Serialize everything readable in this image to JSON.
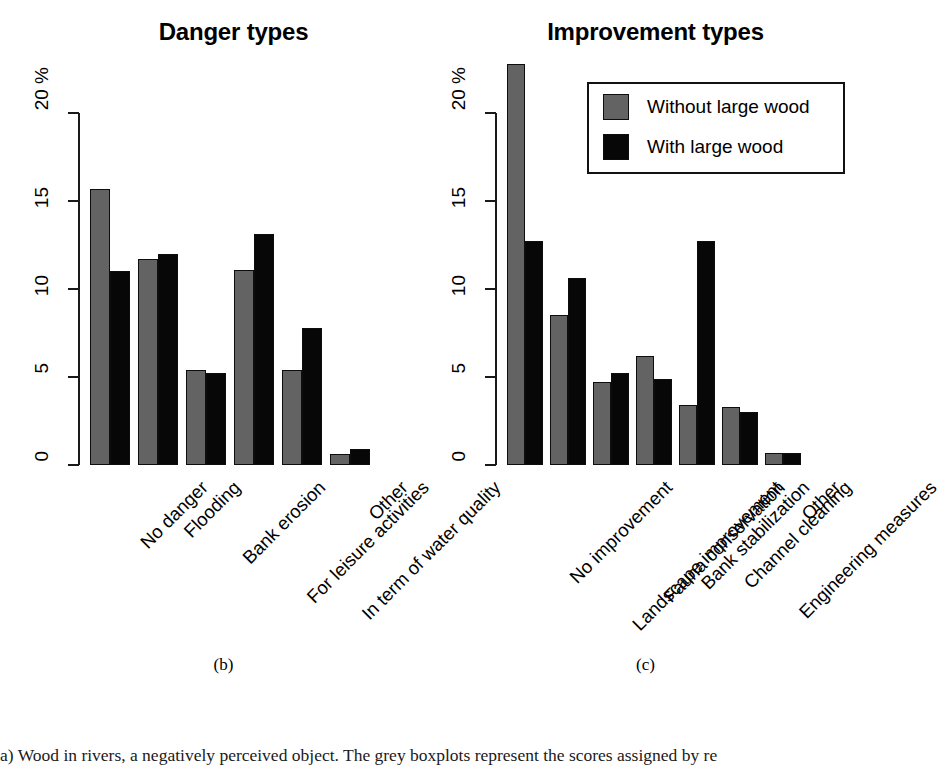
{
  "chart_data": [
    {
      "type": "bar",
      "title": "Danger types",
      "panel_letter": "(b)",
      "xlabel": "",
      "ylabel": "20 %",
      "yticks": [
        0,
        5,
        10,
        15,
        20
      ],
      "ytick_labels": [
        "0",
        "5",
        "10",
        "15",
        "20 %"
      ],
      "ylim": [
        0,
        23
      ],
      "grid": false,
      "categories": [
        "No danger",
        "Flooding",
        "Bank erosion",
        "For leisure activities",
        "In term of water quality",
        "Other"
      ],
      "series": [
        {
          "name": "Without large wood",
          "color": "#636363",
          "values": [
            15.7,
            11.7,
            5.4,
            11.1,
            5.4,
            0.6
          ]
        },
        {
          "name": "With large wood",
          "color": "#070707",
          "values": [
            11.0,
            12.0,
            5.2,
            13.1,
            7.8,
            0.9
          ]
        }
      ]
    },
    {
      "type": "bar",
      "title": "Improvement types",
      "panel_letter": "(c)",
      "xlabel": "",
      "ylabel": "20 %",
      "yticks": [
        0,
        5,
        10,
        15,
        20
      ],
      "ytick_labels": [
        "0",
        "5",
        "10",
        "15",
        "20 %"
      ],
      "ylim": [
        0,
        23
      ],
      "grid": false,
      "legend_position": "top-right",
      "categories": [
        "No improvement",
        "Landscape improvement",
        "Fauna conservation",
        "Bank stabilization",
        "Channel cleaning",
        "Engineering measures",
        "Other"
      ],
      "series": [
        {
          "name": "Without large wood",
          "color": "#636363",
          "values": [
            22.8,
            8.5,
            4.7,
            6.2,
            3.4,
            3.3,
            0.7
          ]
        },
        {
          "name": "With large wood",
          "color": "#070707",
          "values": [
            12.7,
            10.6,
            5.2,
            4.9,
            12.7,
            3.0,
            0.7
          ]
        }
      ]
    }
  ],
  "legend": {
    "items": [
      {
        "label": "Without large wood",
        "color": "#636363"
      },
      {
        "label": "With large wood",
        "color": "#070707"
      }
    ]
  },
  "caption": {
    "text": "a) Wood in rivers, a negatively perceived object. The grey boxplots represent the scores assigned by re"
  },
  "colors": {
    "without_large_wood": "#636363",
    "with_large_wood": "#070707",
    "axis": "#1a1a1a",
    "background": "#ffffff"
  }
}
